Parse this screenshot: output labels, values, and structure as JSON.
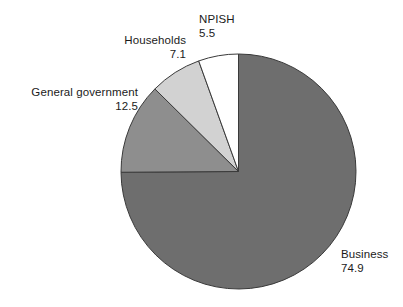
{
  "chart_data": {
    "type": "pie",
    "title": "",
    "subtitle": "",
    "xlabel": "",
    "ylabel": "",
    "legend_position": "none",
    "grid": false,
    "start_angle_deg": 0,
    "direction": "clockwise",
    "total": 100.0,
    "categories": [
      "Business",
      "General government",
      "Households",
      "NPISH"
    ],
    "values": [
      74.9,
      12.5,
      7.1,
      5.5
    ],
    "colors": [
      "#6e6e6e",
      "#8e8e8e",
      "#d2d2d2",
      "#ffffff"
    ],
    "slices": [
      {
        "label": "Business",
        "value": "74.9",
        "value_num": 74.9,
        "color": "#6e6e6e",
        "label_align": "left"
      },
      {
        "label": "General government",
        "value": "12.5",
        "value_num": 12.5,
        "color": "#8e8e8e",
        "label_align": "right"
      },
      {
        "label": "Households",
        "value": "7.1",
        "value_num": 7.1,
        "color": "#d2d2d2",
        "label_align": "right"
      },
      {
        "label": "NPISH",
        "value": "5.5",
        "value_num": 5.5,
        "color": "#ffffff",
        "label_align": "left"
      }
    ],
    "stroke_color": "#3a3a3a",
    "background": "#ffffff"
  }
}
